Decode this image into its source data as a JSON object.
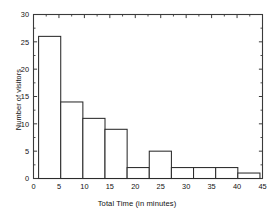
{
  "chart_data": {
    "type": "bar",
    "title": "",
    "xlabel": "Total Time (in minutes)",
    "ylabel": "Number of visitors",
    "xlim": [
      0,
      45
    ],
    "ylim": [
      0,
      30
    ],
    "xticks": [
      0,
      5,
      10,
      15,
      20,
      25,
      30,
      35,
      40,
      45
    ],
    "yticks": [
      0,
      5,
      10,
      15,
      20,
      25,
      30
    ],
    "grid": false,
    "legend": null,
    "minor_ticks": true,
    "frame": "full-box",
    "bin_width": 4.35,
    "bin_edges": [
      1.0,
      5.35,
      9.7,
      14.05,
      18.4,
      22.75,
      27.1,
      31.45,
      35.8,
      40.15,
      44.5
    ],
    "categories": [
      "1-5.4",
      "5.4-9.7",
      "9.7-14.1",
      "14.1-18.4",
      "18.4-22.8",
      "22.8-27.1",
      "27.1-31.5",
      "31.5-35.8",
      "35.8-40.2",
      "40.2-44.5"
    ],
    "values": [
      26,
      14,
      11,
      9,
      2,
      5,
      2,
      2,
      2,
      1
    ],
    "bar_fill": "#ffffff",
    "bar_edge": "#2b2b2b",
    "axis_color": "#3a3a3a"
  },
  "axis": {
    "x_title": "Total Time (in minutes)",
    "y_title": "Number of visitors",
    "x_tick_labels": [
      "0",
      "5",
      "10",
      "15",
      "20",
      "25",
      "30",
      "35",
      "40",
      "45"
    ],
    "y_tick_labels": [
      "0",
      "5",
      "10",
      "15",
      "20",
      "25",
      "30"
    ]
  }
}
